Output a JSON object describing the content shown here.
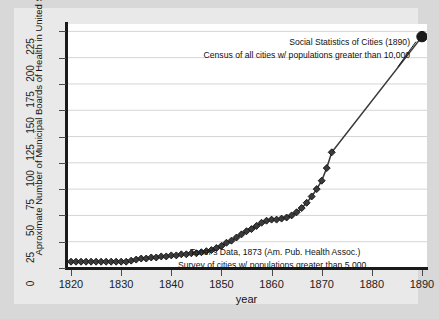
{
  "chart_data": {
    "type": "line",
    "title": "",
    "xlabel": "year",
    "ylabel": "Aproximate Number of Municipal Boards of Health in United States",
    "xlim": [
      1819,
      1891
    ],
    "ylim": [
      0,
      232
    ],
    "xticks": [
      1820,
      1830,
      1840,
      1850,
      1860,
      1870,
      1880,
      1890
    ],
    "yticks": [
      0,
      25,
      50,
      75,
      100,
      125,
      150,
      175,
      200,
      225
    ],
    "grid": "horizontal",
    "legend": "none",
    "marker": "diamond",
    "series": [
      {
        "name": "Toner's Data 1873 series",
        "marker": "diamond",
        "color": "#3a3a3a",
        "x": [
          1820,
          1821,
          1822,
          1823,
          1824,
          1825,
          1826,
          1827,
          1828,
          1829,
          1830,
          1831,
          1832,
          1833,
          1834,
          1835,
          1836,
          1837,
          1838,
          1839,
          1840,
          1841,
          1842,
          1843,
          1844,
          1845,
          1846,
          1847,
          1848,
          1849,
          1850,
          1851,
          1852,
          1853,
          1854,
          1855,
          1856,
          1857,
          1858,
          1859,
          1860,
          1861,
          1862,
          1863,
          1864,
          1865,
          1866,
          1867,
          1868,
          1869,
          1870,
          1871,
          1872
        ],
        "y": [
          6,
          6,
          6,
          6,
          6,
          6,
          6,
          6,
          6,
          6,
          6,
          6,
          7,
          8,
          9,
          9,
          10,
          10,
          11,
          11,
          12,
          12,
          13,
          13,
          14,
          14,
          15,
          16,
          17,
          19,
          21,
          24,
          26,
          29,
          32,
          35,
          37,
          40,
          43,
          45,
          46,
          46,
          47,
          48,
          50,
          53,
          57,
          62,
          68,
          75,
          83,
          95,
          110
        ]
      },
      {
        "name": "Social Statistics of Cities 1890 point",
        "marker": "circle-large",
        "color": "#1a1a1a",
        "x": [
          1890
        ],
        "y": [
          220
        ]
      }
    ],
    "annotations": [
      {
        "name": "top-line1",
        "text": "Social Statistics of Cities (1890)",
        "x": 1890,
        "y": 220
      },
      {
        "name": "top-line2",
        "text": "Census of all cities w/ populations greater than 10,000",
        "x": 1890,
        "y": 220
      },
      {
        "name": "bottom-line1",
        "text": "Toner's Data, 1873 (Am. Pub. Health Assoc.)",
        "x": 1855,
        "y": 18
      },
      {
        "name": "bottom-line2",
        "text": "Survey of cities w/ populations greater than 5,000",
        "x": 1855,
        "y": 12
      }
    ]
  },
  "axes": {
    "x_tick_labels": [
      "1820",
      "1830",
      "1840",
      "1850",
      "1860",
      "1870",
      "1880",
      "1890"
    ],
    "y_tick_labels": [
      "0",
      "25",
      "50",
      "75",
      "100",
      "125",
      "150",
      "175",
      "200",
      "225"
    ],
    "x_axis_title": "year",
    "y_axis_title": "Aproximate Number of Municipal Boards of Health in United States"
  },
  "annotations": {
    "top_line1": "Social Statistics of Cities (1890)",
    "top_line2": "Census of all cities w/ populations greater than 10,000",
    "bottom_line1": "Toner's Data, 1873 (Am. Pub. Health Assoc.)",
    "bottom_line2": "Survey of cities w/ populations greater than 5,000"
  },
  "colors": {
    "figure_background": "#d8d8d8",
    "canvas_background": "#e9e9e9",
    "plot_background": "#ffffff",
    "gridline": "#d5d5d5",
    "axis": "#1a1a1a",
    "marker_fill": "#3a3a3a",
    "marker_edge": "#111111",
    "line": "#1a1a1a"
  }
}
